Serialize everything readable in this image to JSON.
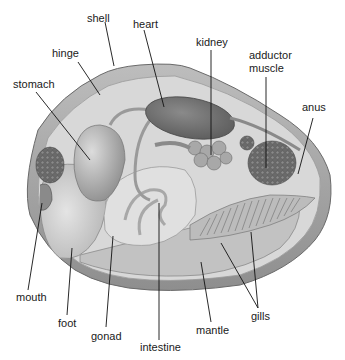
{
  "diagram": {
    "labels": {
      "shell": "shell",
      "heart": "heart",
      "hinge": "hinge",
      "kidney": "kidney",
      "adductor_1": "adductor",
      "adductor_2": "muscle",
      "stomach": "stomach",
      "anus": "anus",
      "mouth": "mouth",
      "foot": "foot",
      "gonad": "gonad",
      "intestine": "intestine",
      "mantle": "mantle",
      "gills": "gills"
    },
    "colors": {
      "background": "#ffffff",
      "shell_outer": "#9a9a9a",
      "shell_inner": "#d6d6d6",
      "body": "#c4c4c4",
      "organ_dark": "#6e6e6e",
      "text": "#1a1a1a"
    }
  }
}
